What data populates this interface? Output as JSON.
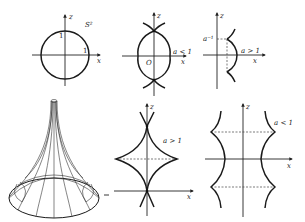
{
  "figure": {
    "panels": [
      {
        "id": "sphere-section",
        "description": "Unit circle S^2 cross-section",
        "labels": {
          "z_axis": "z",
          "x_axis": "x",
          "curve": "S²",
          "z_tick": "1",
          "x_tick": "1"
        }
      },
      {
        "id": "meridian-a-less-1-oval",
        "description": "Oval meridian with cusps on z-axis",
        "labels": {
          "z_axis": "z",
          "x_axis": "x",
          "origin": "O",
          "condition": "a < 1"
        }
      },
      {
        "id": "meridian-a-greater-1-half",
        "description": "Half meridian with cusps, dashed chord",
        "labels": {
          "z_axis": "z",
          "x_axis": "x",
          "z_tick": "a⁻¹",
          "condition": "a > 1"
        }
      },
      {
        "id": "pseudosphere",
        "description": "3D wireframe pseudosphere (tractricoid)",
        "labels": {}
      },
      {
        "id": "meridian-a-greater-1-astroid",
        "description": "Astroid-like curve with cusps on axes",
        "labels": {
          "z_axis": "z",
          "x_axis": "x",
          "condition": "a > 1"
        }
      },
      {
        "id": "meridian-a-less-1-periodic",
        "description": "Periodic cusped curves symmetric about z-axis",
        "labels": {
          "z_axis": "z",
          "x_axis": "x",
          "condition": "a < 1"
        }
      }
    ]
  }
}
